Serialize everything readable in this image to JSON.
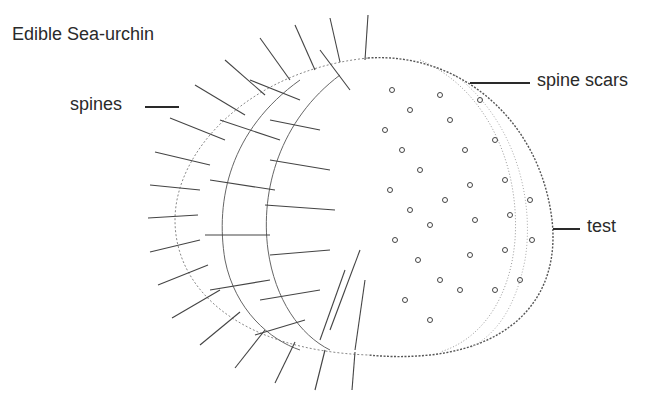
{
  "title": "Edible Sea-urchin",
  "labels": {
    "spines": "spines",
    "spine_scars": "spine scars",
    "test": "test"
  },
  "colors": {
    "ink": "#2a2a2a",
    "background": "#ffffff"
  }
}
